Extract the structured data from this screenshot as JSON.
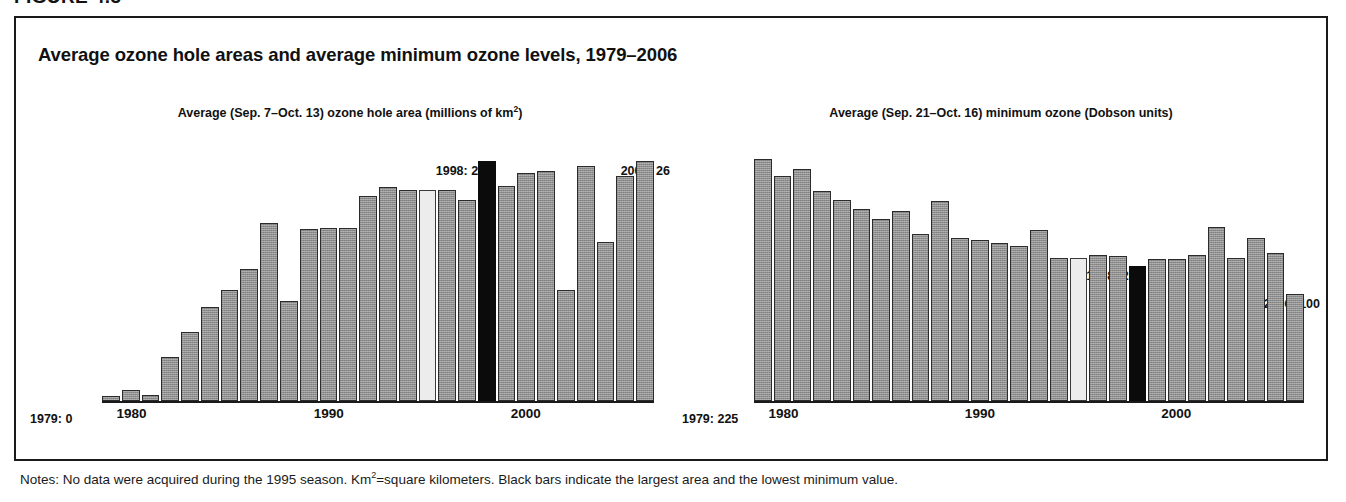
{
  "figure": {
    "number_label": "FIGURE 4.3",
    "title": "Average ozone hole areas and average minimum ozone levels, 1979–2006",
    "notes_part1": "Notes: No data were acquired during the 1995 season. Km",
    "notes_sup": "2",
    "notes_part2": "=square kilometers. Black bars indicate the largest area and the lowest minimum value."
  },
  "chart_data": [
    {
      "id": "ozone-hole-area",
      "type": "bar",
      "title": "Average (Sep. 7–Oct. 13) ozone hole area (millions of km²)",
      "title_main": "Average (Sep. 7–Oct. 13) ozone hole area (millions of km",
      "title_sup": "2",
      "title_tail": ")",
      "xlabel": "",
      "ylabel": "millions of km2",
      "ylim": [
        0,
        28
      ],
      "grid": false,
      "legend": "none",
      "xticks": [
        "1980",
        "1990",
        "2000"
      ],
      "xtick_years": [
        1980,
        1990,
        2000
      ],
      "categories": [
        1979,
        1980,
        1981,
        1982,
        1983,
        1984,
        1985,
        1986,
        1987,
        1988,
        1989,
        1990,
        1991,
        1992,
        1993,
        1994,
        1995,
        1996,
        1997,
        1998,
        1999,
        2000,
        2001,
        2002,
        2003,
        2004,
        2005,
        2006
      ],
      "values": [
        0.1,
        1.2,
        0.6,
        4.8,
        7.5,
        10.2,
        12.1,
        14.3,
        19.3,
        10.9,
        18.7,
        18.8,
        18.8,
        22.3,
        23.2,
        22.9,
        22.9,
        22.9,
        21.8,
        26.0,
        23.3,
        24.8,
        25.0,
        12.0,
        25.5,
        17.3,
        24.4,
        26.0
      ],
      "bar_styles": [
        "gray",
        "gray",
        "gray",
        "gray",
        "gray",
        "gray",
        "gray",
        "gray",
        "gray",
        "gray",
        "gray",
        "gray",
        "gray",
        "gray",
        "gray",
        "gray",
        "light",
        "gray",
        "gray",
        "black",
        "gray",
        "gray",
        "gray",
        "gray",
        "gray",
        "gray",
        "gray",
        "gray"
      ],
      "annotations": [
        {
          "name": "first-year",
          "text": "1979: 0",
          "position": "start"
        },
        {
          "name": "peak-year",
          "text": "1998: 26",
          "position": "peak",
          "year": 1998
        },
        {
          "name": "last-year",
          "text": "2006: 26",
          "position": "end"
        }
      ]
    },
    {
      "id": "minimum-ozone",
      "type": "bar",
      "title": "Average (Sep. 21–Oct. 16) minimum ozone (Dobson units)",
      "title_main": "Average (Sep. 21–Oct. 16) minimum ozone (Dobson units)",
      "title_sup": "",
      "title_tail": "",
      "xlabel": "",
      "ylabel": "Dobson units",
      "ylim": [
        0,
        240
      ],
      "grid": false,
      "legend": "none",
      "xticks": [
        "1980",
        "1990",
        "2000"
      ],
      "xtick_years": [
        1980,
        1990,
        2000
      ],
      "categories": [
        1979,
        1980,
        1981,
        1982,
        1983,
        1984,
        1985,
        1986,
        1987,
        1988,
        1989,
        1990,
        1991,
        1992,
        1993,
        1994,
        1995,
        1996,
        1997,
        1998,
        1999,
        2000,
        2001,
        2002,
        2003,
        2004,
        2005,
        2006
      ],
      "values": [
        225,
        209,
        216,
        195,
        187,
        179,
        169,
        177,
        155,
        186,
        152,
        150,
        147,
        144,
        159,
        133,
        133,
        136,
        135,
        126,
        132,
        132,
        136,
        162,
        133,
        152,
        138,
        100
      ],
      "bar_styles": [
        "gray",
        "gray",
        "gray",
        "gray",
        "gray",
        "gray",
        "gray",
        "gray",
        "gray",
        "gray",
        "gray",
        "gray",
        "gray",
        "gray",
        "gray",
        "gray",
        "light",
        "gray",
        "gray",
        "black",
        "gray",
        "gray",
        "gray",
        "gray",
        "gray",
        "gray",
        "gray",
        "gray"
      ],
      "annotations": [
        {
          "name": "first-year",
          "text": "1979: 225",
          "position": "start"
        },
        {
          "name": "peak-year",
          "text": "1998: 26",
          "position": "peak",
          "year": 1998
        },
        {
          "name": "last-year",
          "text": "2006: 100",
          "position": "end"
        }
      ]
    }
  ],
  "colors": {
    "bar_gray": "#8f8f8f",
    "bar_black": "#0b0b0b",
    "bar_light": "#ececec",
    "frame": "#1a1a1a",
    "text": "#111111"
  }
}
